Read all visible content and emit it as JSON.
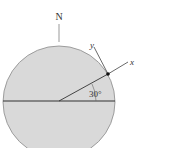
{
  "diagram": {
    "north_label": "N",
    "x_axis_label": "x",
    "y_axis_label": "y",
    "angle_label": "30°",
    "colors": {
      "globe_fill": "#d9d9d9",
      "globe_stroke": "#8a8a8a",
      "line": "#333333",
      "point": "#111111"
    }
  }
}
